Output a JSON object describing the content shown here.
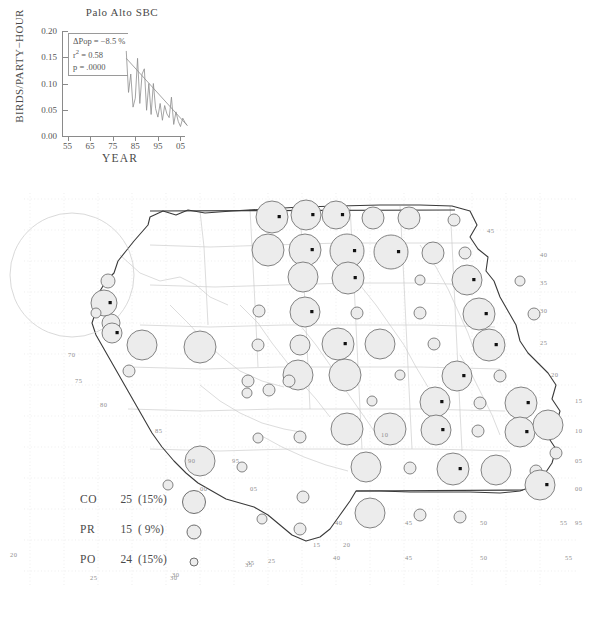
{
  "chart_data": {
    "type": "line",
    "title": "Palo Alto SBC",
    "xlabel": "YEAR",
    "ylabel": "BIRDS/PARTY−HOUR",
    "xlim": [
      53,
      107
    ],
    "ylim": [
      0.0,
      0.2
    ],
    "xticks": [
      "55",
      "65",
      "75",
      "85",
      "95",
      "05"
    ],
    "xtick_values": [
      55,
      65,
      75,
      85,
      95,
      105
    ],
    "yticks": [
      "0.00",
      "0.05",
      "0.10",
      "0.15",
      "0.20"
    ],
    "ytick_values": [
      0.0,
      0.05,
      0.1,
      0.15,
      0.2
    ],
    "grid": false,
    "legend": "none",
    "annotations": {
      "delta_pop_label": "ΔPop =",
      "delta_pop_value": "−8.5 %",
      "r2_label": "r",
      "r2_sup": "2",
      "r2_value": "= 0.58",
      "p_label": "p =",
      "p_value": ".0000"
    },
    "series": [
      {
        "name": "Palo Alto SBC birds per party-hour",
        "x": [
          1981,
          1982,
          1983,
          1984,
          1985,
          1986,
          1987,
          1988,
          1989,
          1990,
          1991,
          1992,
          1993,
          1994,
          1995,
          1996,
          1997,
          1998,
          1999,
          2000,
          2001,
          2002,
          2003,
          2004,
          2005,
          2006,
          2007,
          2008
        ],
        "values": [
          0.162,
          0.083,
          0.118,
          0.055,
          0.072,
          0.148,
          0.062,
          0.118,
          0.128,
          0.049,
          0.1,
          0.041,
          0.1,
          0.052,
          0.036,
          0.062,
          0.03,
          0.058,
          0.042,
          0.035,
          0.074,
          0.022,
          0.046,
          0.028,
          0.018,
          0.034,
          0.026,
          0.02
        ]
      },
      {
        "name": "regression trend line",
        "x": [
          1981,
          2008
        ],
        "values": [
          0.148,
          0.02
        ]
      }
    ]
  },
  "map": {
    "title": "survey circle map",
    "longitude_labels": [
      "70",
      "75",
      "80",
      "85",
      "90",
      "95",
      "00",
      "05",
      "10",
      "15",
      "20",
      "25",
      "30",
      "35",
      "40",
      "45",
      "50",
      "55"
    ],
    "latitude_labels": [
      "45",
      "40",
      "35",
      "30",
      "25",
      "20",
      "15",
      "10",
      "05",
      "00",
      "95"
    ],
    "circle_fill": "#ececec",
    "circle_stroke": "#6e6e6e",
    "border_color": "#3a3a3a",
    "state_line_color": "#c9c9c9"
  },
  "legend": {
    "rows": [
      {
        "code": "CO",
        "count": "25",
        "percent": "(15%)",
        "size": 22
      },
      {
        "code": "PR",
        "count": "15",
        "percent": "( 9%)",
        "size": 13
      },
      {
        "code": "PO",
        "count": "24",
        "percent": "(15%)",
        "size": 7
      }
    ]
  }
}
